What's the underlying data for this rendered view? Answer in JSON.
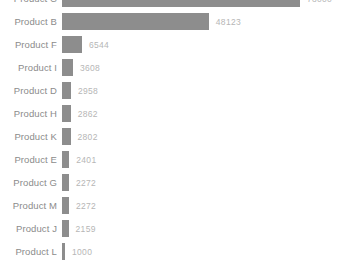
{
  "chart_data": {
    "type": "bar",
    "orientation": "horizontal",
    "title": "",
    "subtitle": "",
    "xlabel": "",
    "ylabel": "",
    "grid": false,
    "legend": null,
    "axis_visible": false,
    "value_labels_shown": true,
    "xlim": [
      0,
      78000
    ],
    "note_top_row_clipped": true,
    "note_bottom_row_clipped": true,
    "categories": [
      "Product C",
      "Product B",
      "Product F",
      "Product I",
      "Product D",
      "Product H",
      "Product K",
      "Product E",
      "Product G",
      "Product M",
      "Product J",
      "Product L"
    ],
    "values": [
      78000,
      48123,
      6544,
      3608,
      2958,
      2862,
      2802,
      2401,
      2272,
      2272,
      2159,
      1000
    ],
    "value_labels": [
      "78000",
      "48123",
      "6544",
      "3608",
      "2958",
      "2862",
      "2802",
      "2401",
      "2272",
      "2272",
      "2159",
      "1000"
    ]
  },
  "style": {
    "bar_color": "#8d8d8d",
    "category_label_color": "#8b8b8b",
    "value_label_color": "#b6b6b6",
    "background_color": "#ffffff"
  }
}
